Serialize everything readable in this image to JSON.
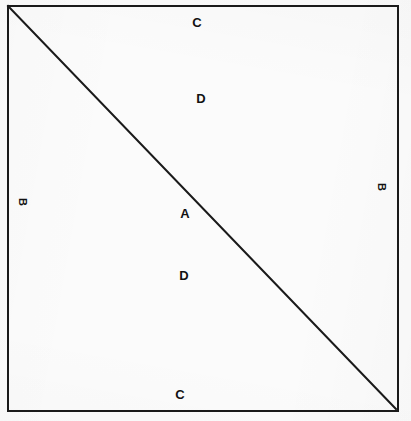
{
  "figure": {
    "background_color": "#fbfbfb",
    "stroke_color": "#1a1a1a",
    "frame": {
      "left": 7,
      "top": 5,
      "right": 397,
      "bottom": 410,
      "stroke_width": 2
    },
    "diagonal": {
      "from_x": 8,
      "from_y": 6,
      "to_x": 396,
      "to_y": 409,
      "stroke_width": 2
    },
    "labels": [
      {
        "id": "label-c-top",
        "text": "C",
        "x": 197,
        "y": 22,
        "rotation": 0
      },
      {
        "id": "label-d-upper",
        "text": "D",
        "x": 201,
        "y": 98,
        "rotation": 0
      },
      {
        "id": "label-b-left",
        "text": "B",
        "x": 22,
        "y": 202,
        "rotation": 90
      },
      {
        "id": "label-a-center",
        "text": "A",
        "x": 185,
        "y": 213,
        "rotation": 0
      },
      {
        "id": "label-b-right",
        "text": "B",
        "x": 381,
        "y": 187,
        "rotation": 90
      },
      {
        "id": "label-d-lower",
        "text": "D",
        "x": 184,
        "y": 275,
        "rotation": 0
      },
      {
        "id": "label-c-bottom",
        "text": "C",
        "x": 180,
        "y": 394,
        "rotation": 0
      }
    ]
  }
}
